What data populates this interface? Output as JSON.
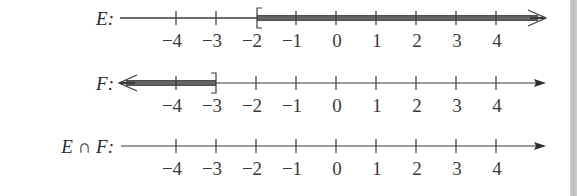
{
  "figure": {
    "tick_values": [
      -4,
      -3,
      -2,
      -1,
      0,
      1,
      2,
      3,
      4
    ],
    "tick_labels": [
      "−4",
      "−3",
      "−2",
      "−1",
      "0",
      "1",
      "2",
      "3",
      "4"
    ],
    "rows": [
      {
        "id": "E",
        "label": "E:",
        "set": "[-2, ∞)",
        "endpoint": -2,
        "endpoint_bracket": "[",
        "direction": "right",
        "shaded": true
      },
      {
        "id": "F",
        "label": "F:",
        "set": "(-∞, -3]",
        "endpoint": -3,
        "endpoint_bracket": "]",
        "direction": "left",
        "shaded": true
      },
      {
        "id": "EintersectF",
        "label_left": "E",
        "label_op": "∩",
        "label_right": "F:",
        "set": "∅",
        "shaded": false
      }
    ],
    "colors": {
      "axis_line": "#3a3a3a",
      "shaded_ray": "#555555",
      "text": "#2a2a2a",
      "page_edge": "#c4c4c4"
    }
  }
}
